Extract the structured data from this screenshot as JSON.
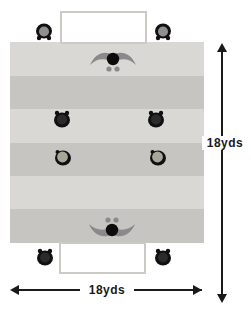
{
  "diagram": {
    "dimensions": {
      "width_label": "18yds",
      "height_label": "18yds"
    },
    "field": {
      "stripes": 6,
      "stripe_light_color": "#d9d8d4",
      "stripe_dark_color": "#c6c5c1"
    },
    "goals": [
      {
        "position": "top"
      },
      {
        "position": "bottom"
      }
    ],
    "players": [
      {
        "role": "server",
        "position": "outside-top-left",
        "shirt": "dark",
        "head": "gray",
        "facing": "down"
      },
      {
        "role": "server",
        "position": "outside-top-right",
        "shirt": "dark",
        "head": "gray",
        "facing": "down"
      },
      {
        "role": "goalkeeper",
        "position": "top-goal-line",
        "arms": "spread",
        "facing": "down"
      },
      {
        "role": "defender",
        "position": "middle-left",
        "shirt": "dark",
        "facing": "up"
      },
      {
        "role": "defender",
        "position": "middle-right",
        "shirt": "dark",
        "facing": "up"
      },
      {
        "role": "attacker",
        "position": "lower-middle-left",
        "shirt": "light",
        "facing": "up"
      },
      {
        "role": "attacker",
        "position": "lower-middle-right",
        "shirt": "light",
        "facing": "up"
      },
      {
        "role": "goalkeeper",
        "position": "bottom-goal-line",
        "arms": "spread",
        "facing": "up"
      },
      {
        "role": "server",
        "position": "outside-bottom-left",
        "shirt": "dark",
        "facing": "up"
      },
      {
        "role": "server",
        "position": "outside-bottom-right",
        "shirt": "dark",
        "facing": "up"
      }
    ],
    "colors": {
      "player_dark": "#101010",
      "keeper_arms": "#8a8a8a",
      "attacker_head": "#a6a899",
      "server_head": "#8f8f8f",
      "goal_border": "#cbcac4",
      "arrow": "#1a1a1a"
    }
  }
}
